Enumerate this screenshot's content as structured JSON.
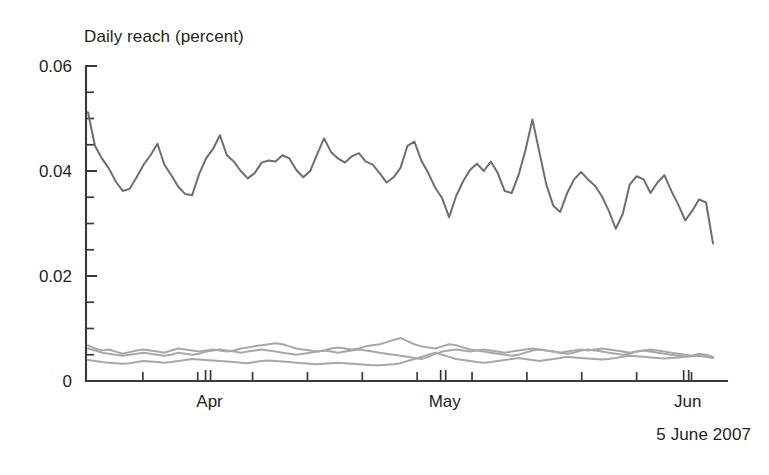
{
  "chart": {
    "title": "Daily reach (percent)",
    "caption": "5 June 2007"
  },
  "chart_data": {
    "type": "line",
    "title": "Daily reach (percent)",
    "subtitle": "",
    "xlabel": "",
    "ylabel": "Daily reach (percent)",
    "ylim": [
      0,
      0.06
    ],
    "ytick_labels": [
      "0",
      "0.02",
      "0.04",
      "0.06"
    ],
    "ytick_values": [
      0,
      0.02,
      0.04,
      0.06
    ],
    "yminor_step": 0.005,
    "grid": false,
    "legend": "none",
    "annotation": "5 June 2007",
    "xlim": [
      "2007-03-17",
      "2007-06-05"
    ],
    "xtick_labels": [
      "Apr",
      "May",
      "Jun"
    ],
    "xtick_positions": [
      "2007-04-01",
      "2007-05-01",
      "2007-06-01"
    ],
    "x_minor_ticks": "weekly",
    "x_month_boundary_double_tick": true,
    "series": [
      {
        "name": "main",
        "color": "#6e6e6e",
        "values": [
          0.0512,
          0.0448,
          0.0424,
          0.0405,
          0.038,
          0.0362,
          0.0366,
          0.0388,
          0.0412,
          0.043,
          0.0452,
          0.0412,
          0.0392,
          0.037,
          0.0356,
          0.0354,
          0.0394,
          0.0424,
          0.0442,
          0.0468,
          0.043,
          0.0418,
          0.04,
          0.0386,
          0.0396,
          0.0416,
          0.042,
          0.0418,
          0.043,
          0.0424,
          0.0402,
          0.0388,
          0.04,
          0.0432,
          0.0462,
          0.0436,
          0.0424,
          0.0416,
          0.0428,
          0.0434,
          0.0418,
          0.0412,
          0.0396,
          0.0378,
          0.0388,
          0.0406,
          0.0448,
          0.0456,
          0.042,
          0.0396,
          0.0368,
          0.0348,
          0.0312,
          0.0352,
          0.038,
          0.0402,
          0.0414,
          0.04,
          0.0418,
          0.0396,
          0.0362,
          0.0358,
          0.0392,
          0.044,
          0.0498,
          0.0436,
          0.0374,
          0.0334,
          0.0322,
          0.0358,
          0.0384,
          0.0398,
          0.0384,
          0.0372,
          0.0352,
          0.0324,
          0.029,
          0.0318,
          0.0374,
          0.039,
          0.0384,
          0.0358,
          0.0378,
          0.0392,
          0.0362,
          0.0336,
          0.0306,
          0.0324,
          0.0346,
          0.034,
          0.0262
        ]
      },
      {
        "name": "low-a",
        "color": "#a8a8a8",
        "values": [
          0.0068,
          0.0062,
          0.0058,
          0.006,
          0.0056,
          0.0052,
          0.0055,
          0.0058,
          0.006,
          0.0058,
          0.0056,
          0.0054,
          0.0058,
          0.0062,
          0.006,
          0.0058,
          0.0056,
          0.0058,
          0.006,
          0.0058,
          0.0056,
          0.0058,
          0.0062,
          0.0064,
          0.0066,
          0.0068,
          0.007,
          0.0072,
          0.007,
          0.0066,
          0.0062,
          0.006,
          0.0058,
          0.0056,
          0.0058,
          0.0062,
          0.0064,
          0.0062,
          0.006,
          0.0062,
          0.0066,
          0.0068,
          0.007,
          0.0074,
          0.0078,
          0.0082,
          0.0076,
          0.007,
          0.0066,
          0.0064,
          0.0062,
          0.0066,
          0.007,
          0.0068,
          0.0064,
          0.006,
          0.0058,
          0.0056,
          0.0054,
          0.0052,
          0.005,
          0.0048,
          0.005,
          0.0054,
          0.0058,
          0.006,
          0.0058,
          0.0056,
          0.0054,
          0.0052,
          0.0054,
          0.0058,
          0.006,
          0.0058,
          0.0056,
          0.0054,
          0.0052,
          0.005,
          0.0052,
          0.0056,
          0.0058,
          0.0056,
          0.0054,
          0.0052,
          0.005,
          0.0048,
          0.0046,
          0.0048,
          0.0052,
          0.005,
          0.0046
        ]
      },
      {
        "name": "low-b",
        "color": "#a8a8a8",
        "values": [
          0.0062,
          0.0058,
          0.0054,
          0.0052,
          0.005,
          0.0048,
          0.005,
          0.0052,
          0.0054,
          0.0052,
          0.005,
          0.0048,
          0.005,
          0.0054,
          0.0052,
          0.005,
          0.0052,
          0.0056,
          0.0058,
          0.006,
          0.0058,
          0.0056,
          0.0054,
          0.0056,
          0.0058,
          0.006,
          0.0058,
          0.0056,
          0.0054,
          0.0052,
          0.005,
          0.0052,
          0.0054,
          0.0056,
          0.0058,
          0.0056,
          0.0054,
          0.0056,
          0.0058,
          0.006,
          0.0058,
          0.0056,
          0.0054,
          0.0052,
          0.005,
          0.0048,
          0.0046,
          0.0044,
          0.0042,
          0.0046,
          0.0052,
          0.0056,
          0.0058,
          0.006,
          0.0058,
          0.0056,
          0.0058,
          0.006,
          0.0058,
          0.0056,
          0.0054,
          0.0056,
          0.0058,
          0.006,
          0.0062,
          0.006,
          0.0058,
          0.0056,
          0.0054,
          0.0056,
          0.0058,
          0.006,
          0.0058,
          0.006,
          0.0062,
          0.006,
          0.0058,
          0.0056,
          0.0054,
          0.0056,
          0.0058,
          0.006,
          0.0058,
          0.0056,
          0.0054,
          0.0052,
          0.005,
          0.0048,
          0.005,
          0.0048,
          0.0044
        ]
      },
      {
        "name": "low-c",
        "color": "#a8a8a8",
        "values": [
          0.004,
          0.0038,
          0.0036,
          0.0035,
          0.0034,
          0.0033,
          0.0034,
          0.0036,
          0.0038,
          0.0037,
          0.0036,
          0.0035,
          0.0036,
          0.0038,
          0.004,
          0.0042,
          0.0041,
          0.004,
          0.0039,
          0.0038,
          0.0037,
          0.0036,
          0.0035,
          0.0034,
          0.0036,
          0.0038,
          0.0039,
          0.0038,
          0.0037,
          0.0036,
          0.0035,
          0.0034,
          0.0033,
          0.0032,
          0.0033,
          0.0034,
          0.0035,
          0.0034,
          0.0033,
          0.0032,
          0.0031,
          0.003,
          0.003,
          0.0031,
          0.0032,
          0.0034,
          0.0038,
          0.0042,
          0.0046,
          0.005,
          0.0054,
          0.005,
          0.0046,
          0.0042,
          0.004,
          0.0038,
          0.0036,
          0.0035,
          0.0036,
          0.0038,
          0.004,
          0.0042,
          0.0044,
          0.0042,
          0.004,
          0.0038,
          0.004,
          0.0042,
          0.0044,
          0.0046,
          0.0045,
          0.0044,
          0.0043,
          0.0042,
          0.0041,
          0.0042,
          0.0044,
          0.0046,
          0.0048,
          0.0047,
          0.0046,
          0.0045,
          0.0044,
          0.0043,
          0.0044,
          0.0045,
          0.0046,
          0.0047,
          0.0048,
          0.0046,
          0.0044
        ]
      }
    ]
  }
}
